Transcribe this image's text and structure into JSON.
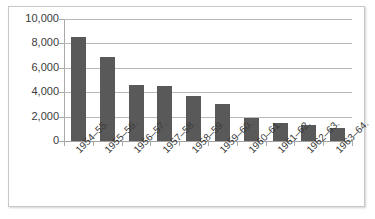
{
  "chart": {
    "type": "bar",
    "bar_color": "#595959",
    "gridline_color": "#b9b9b9",
    "axis_color": "#a9a9a9",
    "border_color": "#c8c8c8"
  },
  "chart_data": {
    "type": "bar",
    "title": "",
    "xlabel": "",
    "ylabel": "",
    "categories": [
      "1954–55.",
      "1955–56.",
      "1956–57.",
      "1957–58.",
      "1958–59.",
      "1959–60.",
      "1960–61.",
      "1961–62.",
      "1962–63.",
      "1963–64."
    ],
    "values": [
      8500,
      6900,
      4600,
      4550,
      3700,
      3050,
      1850,
      1500,
      1300,
      1050
    ],
    "ylim": [
      0,
      10000
    ],
    "ytick_values": [
      0,
      2000,
      4000,
      6000,
      8000,
      10000
    ],
    "ytick_labels": [
      "0",
      "2,000",
      "4,000",
      "6,000",
      "8,000",
      "10,000"
    ],
    "grid": true,
    "legend": false,
    "legend_position": "none"
  }
}
